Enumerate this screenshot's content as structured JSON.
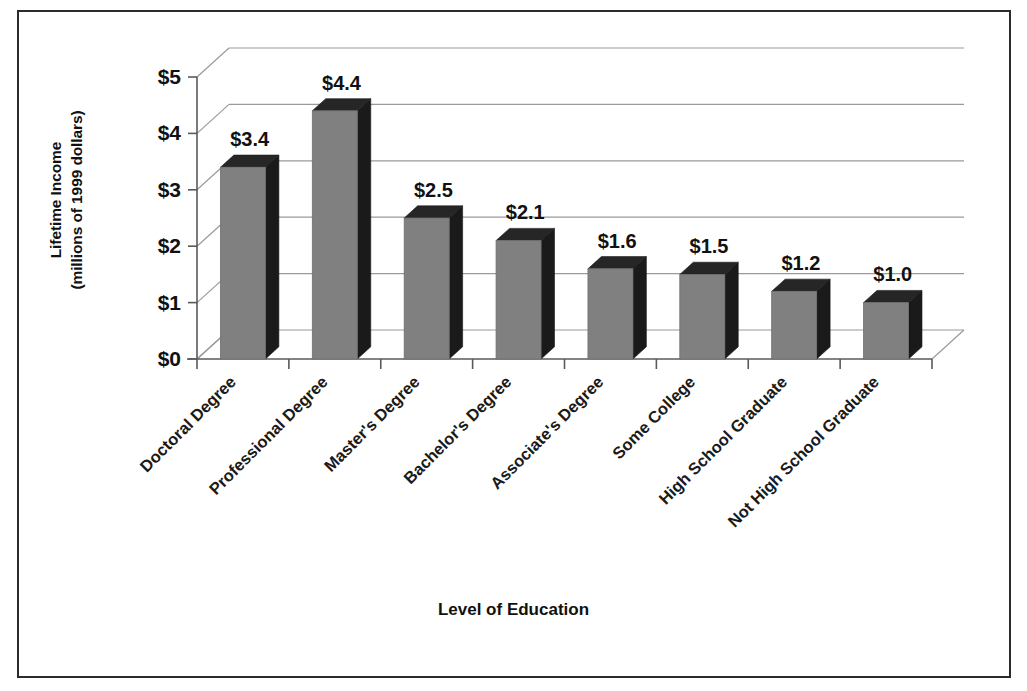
{
  "chart_data": {
    "type": "bar",
    "title": "",
    "subtitle": "",
    "xlabel": "Level of Education",
    "ylabel_line1": "Lifetime Income",
    "ylabel_line2": "(millions of 1999 dollars)",
    "categories": [
      "Doctoral Degree",
      "Professional Degree",
      "Master's Degree",
      "Bachelor's Degree",
      "Associate's Degree",
      "Some College",
      "High School Graduate",
      "Not High School Graduate"
    ],
    "values": [
      3.4,
      4.4,
      2.5,
      2.1,
      1.6,
      1.5,
      1.2,
      1.0
    ],
    "value_labels": [
      "$3.4",
      "$4.4",
      "$2.5",
      "$2.1",
      "$1.6",
      "$1.5",
      "$1.2",
      "$1.0"
    ],
    "ytick_values": [
      0,
      1,
      2,
      3,
      4,
      5
    ],
    "ytick_labels": [
      "$0",
      "$1",
      "$2",
      "$3",
      "$4",
      "$5"
    ],
    "ylim": [
      0,
      5
    ],
    "grid": true,
    "legend": "none",
    "style": "3d-column",
    "colors": {
      "bar_front": "#808080",
      "bar_side": "#1a1a1a",
      "bar_top": "#262626",
      "axis_line": "#5a5a5a",
      "grid_line": "#9a9a9a",
      "frame": "#2b2b2b",
      "text": "#111111",
      "background": "#ffffff"
    }
  }
}
